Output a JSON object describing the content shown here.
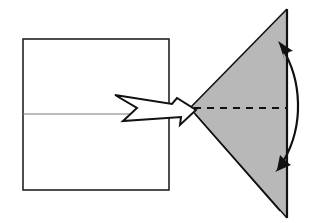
{
  "diagram": {
    "type": "origami-fold-step",
    "colors": {
      "background": "#ffffff",
      "paper_front": "#ffffff",
      "paper_back": "#b8b8b8",
      "line": "#111111",
      "crease": "#999999"
    },
    "elements": {
      "square": {
        "label": "unfolded-square",
        "x": 23,
        "y": 39,
        "w": 146,
        "h": 151,
        "center_crease_y": 114
      },
      "transition_arrow": {
        "label": "result-arrow",
        "direction": "right"
      },
      "triangle": {
        "label": "folded-triangle",
        "top": [
          287,
          9
        ],
        "bottom": [
          287,
          218
        ],
        "apex": [
          190,
          108
        ]
      },
      "valley_fold_line": {
        "label": "dashed-fold-line",
        "style": "dashed",
        "y": 108
      },
      "fold_arrow": {
        "label": "fold-up-down-arrow",
        "style": "curved-double-headed"
      }
    }
  }
}
